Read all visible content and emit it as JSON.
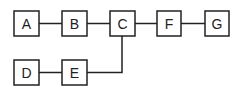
{
  "diagram": {
    "type": "block-diagram",
    "nodes": [
      {
        "id": "A",
        "label": "A"
      },
      {
        "id": "B",
        "label": "B"
      },
      {
        "id": "C",
        "label": "C"
      },
      {
        "id": "F",
        "label": "F"
      },
      {
        "id": "G",
        "label": "G"
      },
      {
        "id": "D",
        "label": "D"
      },
      {
        "id": "E",
        "label": "E"
      }
    ],
    "edges": [
      {
        "from": "A",
        "to": "B"
      },
      {
        "from": "B",
        "to": "C"
      },
      {
        "from": "C",
        "to": "F"
      },
      {
        "from": "F",
        "to": "G"
      },
      {
        "from": "D",
        "to": "E"
      },
      {
        "from": "E",
        "to": "C"
      }
    ],
    "colors": {
      "stroke": "#222222",
      "background": "#ffffff"
    }
  }
}
